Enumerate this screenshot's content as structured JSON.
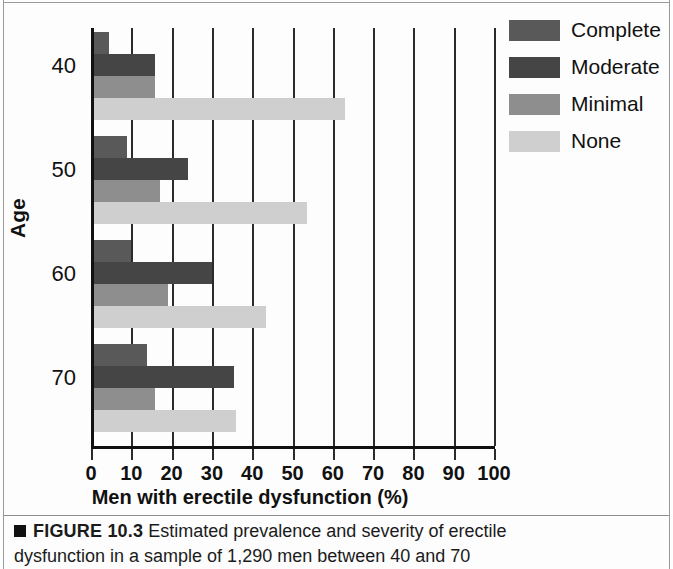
{
  "chart_data": {
    "type": "bar",
    "orientation": "horizontal",
    "title": "",
    "xlabel": "Men with erectile dysfunction (%)",
    "ylabel": "Age",
    "xlim": [
      0,
      100
    ],
    "xticks": [
      0,
      10,
      20,
      30,
      40,
      50,
      60,
      70,
      80,
      90,
      100
    ],
    "xtick_labels": [
      "0",
      "10",
      "20",
      "30",
      "40",
      "50",
      "60",
      "70",
      "80",
      "90",
      "100"
    ],
    "categories": [
      "40",
      "50",
      "60",
      "70"
    ],
    "grid": "vertical",
    "legend_position": "top-right",
    "series": [
      {
        "name": "Complete",
        "color": "#595959",
        "values": [
          4.5,
          9,
          10,
          14
        ]
      },
      {
        "name": "Moderate",
        "color": "#454545",
        "values": [
          16,
          24,
          30,
          35.5
        ]
      },
      {
        "name": "Minimal",
        "color": "#8e8e8e",
        "values": [
          16,
          17,
          19,
          16
        ]
      },
      {
        "name": "None",
        "color": "#cfcfcf",
        "values": [
          63,
          53.5,
          43.5,
          36
        ]
      }
    ]
  },
  "legend": {
    "items": [
      {
        "label": "Complete"
      },
      {
        "label": "Moderate"
      },
      {
        "label": "Minimal"
      },
      {
        "label": "None"
      }
    ]
  },
  "caption": {
    "marker": "",
    "figure_number": "FIGURE 10.3",
    "line1": " Estimated prevalence and severity of erectile",
    "line2": "dysfunction in a sample of 1,290 men between 40 and 70"
  }
}
